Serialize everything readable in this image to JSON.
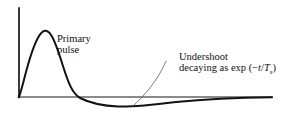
{
  "figure": {
    "background_color": "#ffffff",
    "ink_color": "#111113",
    "leader_color": "#5d5d63",
    "width": 282,
    "height": 113,
    "axes": {
      "vertical_axis_name": "amplitude-axis",
      "horizontal_axis_name": "time-axis",
      "origin_x": 19,
      "baseline_y": 97,
      "axis_top_y": 8,
      "axis_right_x": 272,
      "stroke_width": 1.4
    },
    "annotations": {
      "primary_pulse": {
        "line1": "Primary",
        "line2": "pulse",
        "x": 57,
        "y": 33
      },
      "undershoot": {
        "line1": "Undershoot",
        "line2_prefix": "decaying as exp (−",
        "line2_var": "t",
        "line2_mid": "/",
        "line2_tau": "T",
        "line2_tau_sub": "s",
        "line2_suffix": ")",
        "x": 179,
        "y": 51
      }
    },
    "leader": {
      "name": "undershoot-leader-line",
      "from_x": 133,
      "from_y": 106,
      "to_x": 166,
      "to_y": 61
    }
  },
  "chart_data": {
    "type": "line",
    "title": "",
    "xlabel": "",
    "ylabel": "",
    "grid": false,
    "legend": "none",
    "xlim": [
      0,
      282
    ],
    "ylim": [
      -0.12,
      1.0
    ],
    "series": [
      {
        "name": "pulse-response",
        "description": "Sharp primary pulse followed by a slow exponential undershoot",
        "path": "M 19 97 C 24 84, 29 52, 39 36 C 49 20, 56 44, 63 66 C 68 82, 72 93, 80 98 C 92 104, 104 106, 118 106.5 C 134 107, 152 105, 176 102 C 206 99, 240 97.6, 272 97.2",
        "x": [
          19,
          26,
          32,
          39,
          46,
          53,
          60,
          67,
          74,
          82,
          92,
          104,
          118,
          134,
          152,
          176,
          206,
          240,
          272
        ],
        "y_pixels": [
          97,
          75,
          51,
          36,
          37,
          50,
          70,
          85,
          94,
          98.5,
          103.5,
          105.8,
          106.5,
          106.6,
          105.2,
          102.3,
          99.4,
          97.9,
          97.2
        ],
        "peak": {
          "x": 39,
          "y": 36,
          "value": 1.0
        },
        "zero_crossing_x": 76,
        "undershoot_min": {
          "x": 122,
          "y": 106.6,
          "value": -0.105
        },
        "baseline_y": 97
      }
    ]
  }
}
